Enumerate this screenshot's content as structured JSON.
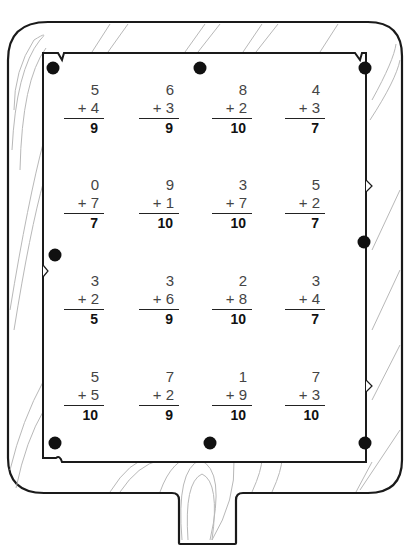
{
  "worksheet": {
    "type": "addition facts",
    "problems": [
      {
        "top": "5",
        "addend": "+ 4",
        "answer": "9"
      },
      {
        "top": "6",
        "addend": "+ 3",
        "answer": "9"
      },
      {
        "top": "8",
        "addend": "+ 2",
        "answer": "10"
      },
      {
        "top": "4",
        "addend": "+ 3",
        "answer": "7"
      },
      {
        "top": "0",
        "addend": "+ 7",
        "answer": "7"
      },
      {
        "top": "9",
        "addend": "+ 1",
        "answer": "10"
      },
      {
        "top": "3",
        "addend": "+ 7",
        "answer": "10"
      },
      {
        "top": "5",
        "addend": "+ 2",
        "answer": "7"
      },
      {
        "top": "3",
        "addend": "+ 2",
        "answer": "5"
      },
      {
        "top": "3",
        "addend": "+ 6",
        "answer": "9"
      },
      {
        "top": "2",
        "addend": "+ 8",
        "answer": "10"
      },
      {
        "top": "3",
        "addend": "+ 4",
        "answer": "7"
      },
      {
        "top": "5",
        "addend": "+ 5",
        "answer": "10"
      },
      {
        "top": "7",
        "addend": "+ 2",
        "answer": "9"
      },
      {
        "top": "1",
        "addend": "+ 9",
        "answer": "10"
      },
      {
        "top": "7",
        "addend": "+ 3",
        "answer": "10"
      }
    ]
  },
  "colors": {
    "outline": "#1a1a1a",
    "wood_grain": "#b0b0b0",
    "paper": "#ffffff",
    "tack": "#111111"
  }
}
